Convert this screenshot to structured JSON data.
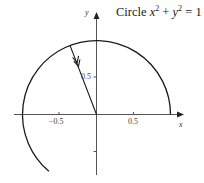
{
  "title": {
    "prefix": "Circle",
    "var1": "x",
    "exp1": "2",
    "plus": "+",
    "var2": "y",
    "exp2": "2",
    "equals": "= 1"
  },
  "axes": {
    "x_label": "x",
    "y_label": "y",
    "x_ticks": [
      "−0.5",
      "0.5"
    ],
    "y_ticks": [
      "0.5"
    ]
  },
  "colors": {
    "curve": "#1a1a1a",
    "axis": "#555555",
    "background": "#ffffff"
  },
  "diagram": {
    "shape": "unit circle arc",
    "arc_start_deg": 0,
    "arc_end_deg": 230,
    "radius_line_angle_deg": 111,
    "arrow_direction": "toward origin"
  }
}
